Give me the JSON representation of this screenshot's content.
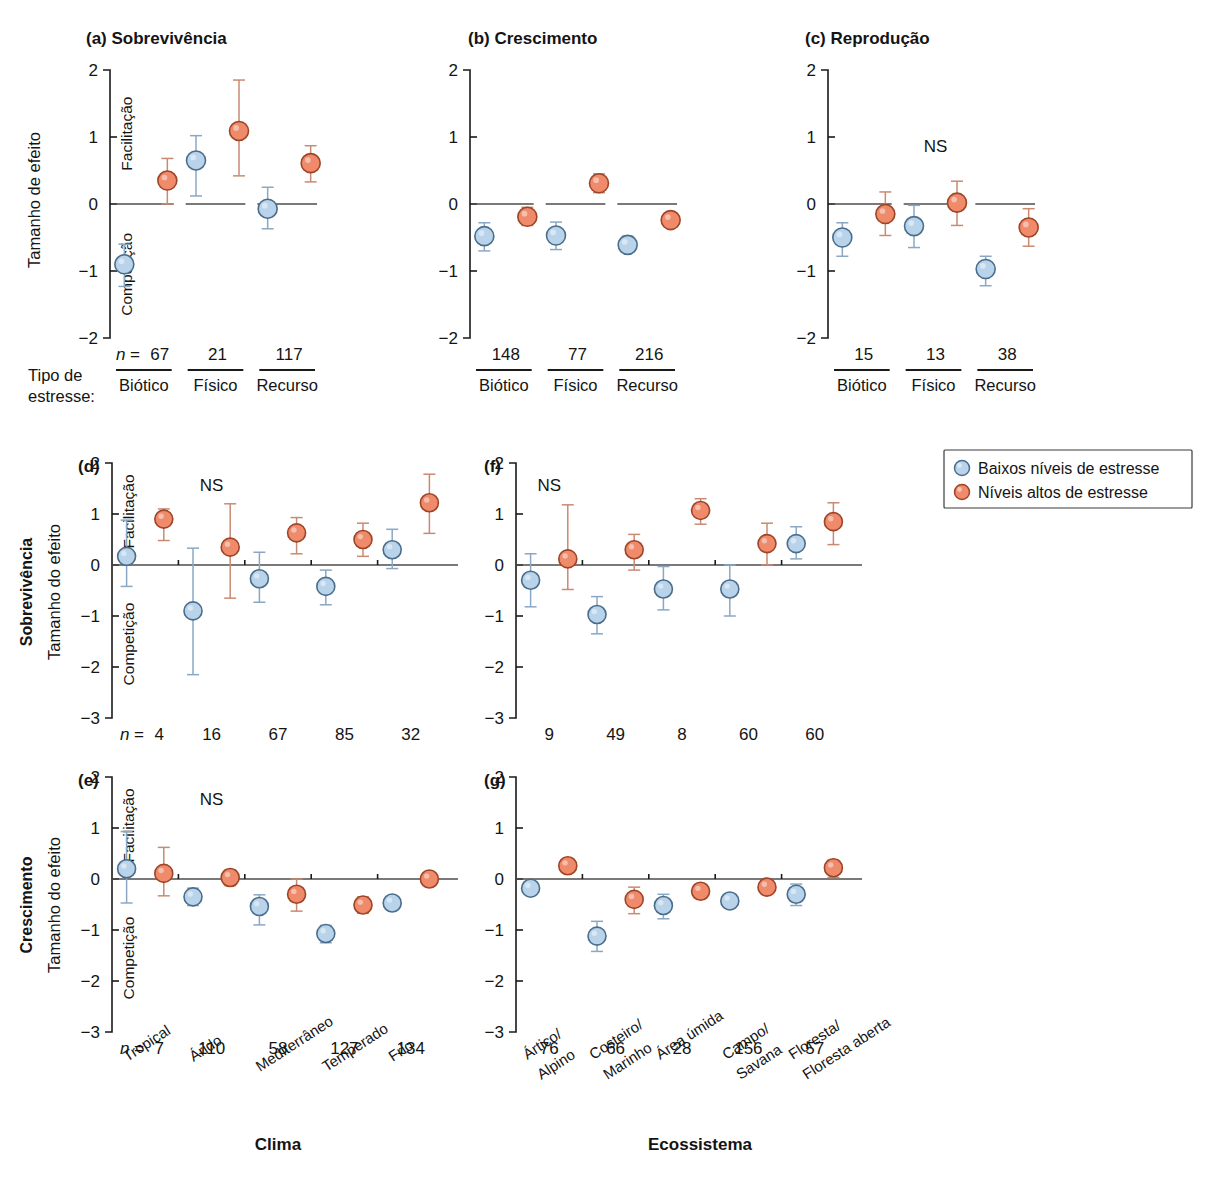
{
  "colors": {
    "low_stress_fill": "#b9d4ea",
    "low_stress_stroke": "#4a6d8c",
    "high_stress_fill": "#ef8a6b",
    "high_stress_stroke": "#9e4427",
    "axis": "#1a1a1a"
  },
  "legend": {
    "position": "right-middle",
    "items": [
      {
        "label": "Baixos níveis de estresse",
        "series": "low"
      },
      {
        "label": "Níveis altos de estresse",
        "series": "high"
      }
    ]
  },
  "labels": {
    "y_axis_top": "Tamanho de efeito",
    "y_axis_do": "Tamanho do efeito",
    "facilitation": "Facilitação",
    "competition": "Competição",
    "n_equals": "n =",
    "n_italic": "n",
    "ns": "NS",
    "stress_type_line1": "Tipo de",
    "stress_type_line2": "estresse:",
    "row_survival": "Sobrevivência",
    "row_growth": "Crescimento",
    "x_title_climate": "Clima",
    "x_title_ecosystem": "Ecossistema"
  },
  "chart_data": [
    {
      "id": "a",
      "type": "scatter",
      "title": "(a) Sobrevivência",
      "panel_letter": "(a)",
      "panel_name": "Sobrevivência",
      "ylabel": "Tamanho de efeito",
      "xlabel": "Tipo de estresse:",
      "ylim": [
        -2,
        2
      ],
      "yticks": [
        2,
        1,
        0,
        -1,
        -2
      ],
      "categories": [
        "Biótico",
        "Físico",
        "Recurso"
      ],
      "n": [
        67,
        21,
        117
      ],
      "ns_flags": [
        false,
        false,
        false
      ],
      "series": [
        {
          "name": "Baixos níveis de estresse",
          "key": "low",
          "values": [
            -0.9,
            0.65,
            -0.07
          ],
          "lower": [
            -1.23,
            0.12,
            -0.37
          ],
          "upper": [
            -0.6,
            1.02,
            0.25
          ],
          "present": [
            true,
            true,
            true
          ]
        },
        {
          "name": "Níveis altos de estresse",
          "key": "high",
          "values": [
            0.35,
            1.09,
            0.61
          ],
          "lower": [
            0.0,
            0.42,
            0.33
          ],
          "upper": [
            0.68,
            1.85,
            0.87
          ],
          "present": [
            true,
            true,
            true
          ]
        }
      ]
    },
    {
      "id": "b",
      "type": "scatter",
      "title": "(b) Crescimento",
      "panel_letter": "(b)",
      "panel_name": "Crescimento",
      "ylabel": "",
      "xlabel": "Tipo de estresse:",
      "ylim": [
        -2,
        2
      ],
      "yticks": [
        2,
        1,
        0,
        -1,
        -2
      ],
      "categories": [
        "Biótico",
        "Físico",
        "Recurso"
      ],
      "n": [
        148,
        77,
        216
      ],
      "ns_flags": [
        false,
        false,
        false
      ],
      "series": [
        {
          "name": "Baixos níveis de estresse",
          "key": "low",
          "values": [
            -0.48,
            -0.47,
            -0.61
          ],
          "lower": [
            -0.7,
            -0.68,
            -0.72
          ],
          "upper": [
            -0.28,
            -0.27,
            -0.48
          ],
          "present": [
            true,
            true,
            true
          ]
        },
        {
          "name": "Níveis altos de estresse",
          "key": "high",
          "values": [
            -0.19,
            0.31,
            -0.24
          ],
          "lower": [
            -0.32,
            0.17,
            -0.33
          ],
          "upper": [
            -0.05,
            0.45,
            -0.14
          ],
          "present": [
            true,
            true,
            true
          ]
        }
      ]
    },
    {
      "id": "c",
      "type": "scatter",
      "title": "(c) Reprodução",
      "panel_letter": "(c)",
      "panel_name": "Reprodução",
      "ylabel": "",
      "xlabel": "Tipo de estresse:",
      "ylim": [
        -2,
        2
      ],
      "yticks": [
        2,
        1,
        0,
        -1,
        -2
      ],
      "categories": [
        "Biótico",
        "Físico",
        "Recurso"
      ],
      "n": [
        15,
        13,
        38
      ],
      "ns_flags": [
        false,
        true,
        false
      ],
      "series": [
        {
          "name": "Baixos níveis de estresse",
          "key": "low",
          "values": [
            -0.5,
            -0.33,
            -0.97
          ],
          "lower": [
            -0.78,
            -0.65,
            -1.22
          ],
          "upper": [
            -0.28,
            -0.02,
            -0.78
          ],
          "present": [
            true,
            true,
            true
          ]
        },
        {
          "name": "Níveis altos de estresse",
          "key": "high",
          "values": [
            -0.15,
            0.02,
            -0.35
          ],
          "lower": [
            -0.47,
            -0.32,
            -0.63
          ],
          "upper": [
            0.18,
            0.34,
            -0.07
          ],
          "present": [
            true,
            true,
            true
          ]
        }
      ]
    },
    {
      "id": "d",
      "type": "scatter",
      "title": "(d)",
      "panel_letter": "(d)",
      "panel_name": "Sobrevivência",
      "row_label": "Sobrevivência",
      "ylabel": "Tamanho do efeito",
      "xlabel": "Clima",
      "ylim": [
        -3,
        2
      ],
      "yticks": [
        2,
        1,
        0,
        -1,
        -2,
        -3
      ],
      "categories": [
        "Tropical",
        "Árido",
        "Mediterrâneo",
        "Temperado",
        "Frio"
      ],
      "n": [
        4,
        16,
        67,
        85,
        32
      ],
      "ns_flags": [
        false,
        true,
        false,
        false,
        false
      ],
      "series": [
        {
          "name": "Baixos níveis de estresse",
          "key": "low",
          "values": [
            0.17,
            -0.9,
            -0.27,
            -0.42,
            0.3
          ],
          "lower": [
            -0.42,
            -2.15,
            -0.73,
            -0.78,
            -0.07
          ],
          "upper": [
            0.88,
            0.33,
            0.25,
            -0.1,
            0.7
          ],
          "present": [
            true,
            true,
            true,
            true,
            true
          ]
        },
        {
          "name": "Níveis altos de estresse",
          "key": "high",
          "values": [
            0.9,
            0.35,
            0.63,
            0.5,
            1.22
          ],
          "lower": [
            0.48,
            -0.65,
            0.22,
            0.17,
            0.62
          ],
          "upper": [
            1.1,
            1.2,
            0.93,
            0.82,
            1.78
          ],
          "present": [
            true,
            true,
            true,
            true,
            true
          ]
        }
      ]
    },
    {
      "id": "e",
      "type": "scatter",
      "title": "(e)",
      "panel_letter": "(e)",
      "panel_name": "Crescimento",
      "row_label": "Crescimento",
      "ylabel": "Tamanho do efeito",
      "xlabel": "Clima",
      "ylim": [
        -3,
        2
      ],
      "yticks": [
        2,
        1,
        0,
        -1,
        -2,
        -3
      ],
      "categories": [
        "Tropical",
        "Árido",
        "Mediterrâneo",
        "Temperado",
        "Frio"
      ],
      "n": [
        7,
        110,
        58,
        127,
        134
      ],
      "ns_flags": [
        false,
        true,
        false,
        false,
        false
      ],
      "series": [
        {
          "name": "Baixos níveis de estresse",
          "key": "low",
          "values": [
            0.2,
            -0.35,
            -0.54,
            -1.07,
            -0.47
          ],
          "lower": [
            -0.47,
            -0.52,
            -0.9,
            -1.25,
            -0.57
          ],
          "upper": [
            0.93,
            -0.18,
            -0.31,
            -0.91,
            -0.38
          ],
          "present": [
            true,
            true,
            true,
            true,
            true
          ]
        },
        {
          "name": "Níveis altos de estresse",
          "key": "high",
          "values": [
            0.11,
            0.03,
            -0.3,
            -0.51,
            0.0
          ],
          "lower": [
            -0.33,
            -0.13,
            -0.63,
            -0.67,
            -0.1
          ],
          "upper": [
            0.62,
            0.18,
            0.0,
            -0.35,
            0.11
          ],
          "present": [
            true,
            true,
            true,
            true,
            true
          ]
        }
      ]
    },
    {
      "id": "f",
      "type": "scatter",
      "title": "(f)",
      "panel_letter": "(f)",
      "panel_name": "Sobrevivência",
      "ylabel": "",
      "xlabel": "Ecossistema",
      "ylim": [
        -3,
        2
      ],
      "yticks": [
        2,
        1,
        0,
        -1,
        -2,
        -3
      ],
      "categories": [
        "Ártico/\nAlpino",
        "Costeiro/\nMarinho",
        "Área úmida",
        "Campo/\nSavana",
        "Floresta/\nFloresta aberta"
      ],
      "n": [
        9,
        49,
        8,
        60,
        60
      ],
      "ns_flags": [
        true,
        false,
        false,
        false,
        false
      ],
      "series": [
        {
          "name": "Baixos níveis de estresse",
          "key": "low",
          "values": [
            -0.3,
            -0.97,
            -0.47,
            -0.47,
            0.42
          ],
          "lower": [
            -0.82,
            -1.35,
            -0.88,
            -1.0,
            0.12
          ],
          "upper": [
            0.22,
            -0.62,
            -0.03,
            0.0,
            0.75
          ],
          "present": [
            true,
            true,
            true,
            true,
            true
          ]
        },
        {
          "name": "Níveis altos de estresse",
          "key": "high",
          "values": [
            0.12,
            0.3,
            1.07,
            0.42,
            0.85
          ],
          "lower": [
            -0.48,
            -0.1,
            0.8,
            0.0,
            0.4
          ],
          "upper": [
            1.18,
            0.6,
            1.3,
            0.82,
            1.22
          ],
          "present": [
            true,
            true,
            true,
            true,
            true
          ]
        }
      ]
    },
    {
      "id": "g",
      "type": "scatter",
      "title": "(g)",
      "panel_letter": "(g)",
      "panel_name": "Crescimento",
      "ylabel": "",
      "xlabel": "Ecossistema",
      "ylim": [
        -3,
        2
      ],
      "yticks": [
        2,
        1,
        0,
        -1,
        -2,
        -3
      ],
      "categories": [
        "Ártico/\nAlpino",
        "Costeiro/\nMarinho",
        "Área úmida",
        "Campo/\nSavana",
        "Floresta/\nFloresta aberta"
      ],
      "n": [
        76,
        66,
        28,
        156,
        57
      ],
      "ns_flags": [
        false,
        false,
        false,
        false,
        false
      ],
      "series": [
        {
          "name": "Baixos níveis de estresse",
          "key": "low",
          "values": [
            -0.18,
            -1.12,
            -0.52,
            -0.43,
            -0.3
          ],
          "lower": [
            -0.28,
            -1.42,
            -0.78,
            -0.57,
            -0.52
          ],
          "upper": [
            -0.08,
            -0.83,
            -0.3,
            -0.3,
            -0.1
          ],
          "present": [
            true,
            true,
            true,
            true,
            true
          ]
        },
        {
          "name": "Níveis altos de estresse",
          "key": "high",
          "values": [
            0.26,
            -0.4,
            -0.24,
            -0.16,
            0.22
          ],
          "lower": [
            0.13,
            -0.68,
            -0.37,
            -0.28,
            0.03
          ],
          "upper": [
            0.4,
            -0.16,
            -0.1,
            -0.02,
            0.37
          ],
          "present": [
            true,
            true,
            true,
            true,
            true
          ]
        }
      ]
    }
  ]
}
